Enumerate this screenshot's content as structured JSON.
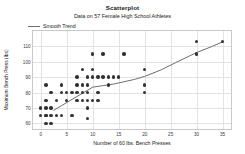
{
  "chart_data": {
    "type": "scatter",
    "title": "Scatterplot",
    "subtitle": "Data on 57 Female High School Athletes",
    "xlabel": "Number of 60 lbs. Bench Presses",
    "ylabel": "Maximum Bench Press (lbs)",
    "xlim": [
      -1.5,
      37
    ],
    "ylim": [
      55,
      120
    ],
    "grid": true,
    "xticks": [
      0,
      5,
      10,
      15,
      20,
      25,
      30,
      35
    ],
    "xtick_labels": [
      "0",
      "5",
      "10",
      "15",
      "20",
      "25",
      "30",
      "35"
    ],
    "yticks": [
      60,
      70,
      80,
      90,
      100,
      110
    ],
    "ytick_labels": [
      "60",
      "70",
      "80",
      "90",
      "100",
      "110"
    ],
    "legend": {
      "position": "top-left",
      "entries": [
        {
          "label": "Smooth Trend",
          "marker": "line",
          "color": "#6e6e6e"
        }
      ]
    },
    "point_color": "#333333",
    "series": [
      {
        "name": "Female High School Athletes",
        "type": "scatter",
        "points": [
          [
            0,
            65
          ],
          [
            0,
            70
          ],
          [
            1,
            60
          ],
          [
            1,
            65
          ],
          [
            1,
            65
          ],
          [
            1,
            70
          ],
          [
            1,
            75
          ],
          [
            1,
            85
          ],
          [
            2,
            60
          ],
          [
            2,
            65
          ],
          [
            2,
            70
          ],
          [
            2,
            80
          ],
          [
            3,
            65
          ],
          [
            3,
            75
          ],
          [
            4,
            65
          ],
          [
            4,
            80
          ],
          [
            4,
            85
          ],
          [
            5,
            75
          ],
          [
            5,
            80
          ],
          [
            6,
            65
          ],
          [
            6,
            80
          ],
          [
            7,
            75
          ],
          [
            7,
            80
          ],
          [
            7,
            85
          ],
          [
            7,
            90
          ],
          [
            8,
            75
          ],
          [
            8,
            80
          ],
          [
            8,
            85
          ],
          [
            8,
            95
          ],
          [
            9,
            63
          ],
          [
            9,
            70
          ],
          [
            9,
            75
          ],
          [
            9,
            80
          ],
          [
            9,
            85
          ],
          [
            9,
            90
          ],
          [
            10,
            75
          ],
          [
            10,
            90
          ],
          [
            10,
            95
          ],
          [
            10,
            105
          ],
          [
            11,
            75
          ],
          [
            11,
            80
          ],
          [
            11,
            90
          ],
          [
            12,
            90
          ],
          [
            12,
            105
          ],
          [
            13,
            85
          ],
          [
            13,
            90
          ],
          [
            14,
            90
          ],
          [
            15,
            90
          ],
          [
            16,
            105
          ],
          [
            20,
            80
          ],
          [
            20,
            85
          ],
          [
            20,
            95
          ],
          [
            30,
            105
          ],
          [
            30,
            113
          ],
          [
            35,
            113
          ]
        ]
      },
      {
        "name": "Smooth Trend",
        "type": "line",
        "color": "#6e6e6e",
        "points": [
          [
            2.5,
            68.5
          ],
          [
            4,
            71.5
          ],
          [
            6,
            75.5
          ],
          [
            8,
            79.5
          ],
          [
            10,
            83.5
          ],
          [
            12,
            84.5
          ],
          [
            14,
            85.5
          ],
          [
            16,
            87
          ],
          [
            18,
            88.5
          ],
          [
            20,
            90.5
          ],
          [
            23,
            94.5
          ],
          [
            26,
            99.5
          ],
          [
            30,
            106
          ],
          [
            33,
            110
          ],
          [
            35,
            113
          ]
        ]
      }
    ]
  }
}
